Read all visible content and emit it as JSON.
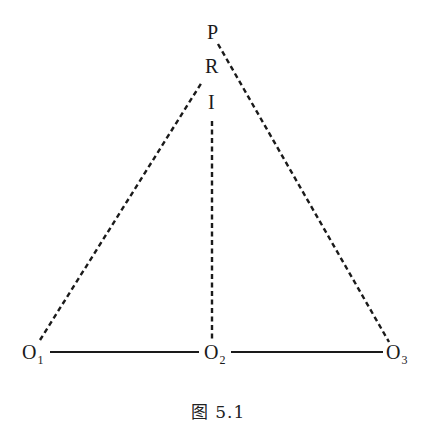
{
  "labels": {
    "P": "P",
    "R": "R",
    "I": "I",
    "O1": {
      "main": "O",
      "sub": "1"
    },
    "O2": {
      "main": "O",
      "sub": "2"
    },
    "O3": {
      "main": "O",
      "sub": "3"
    }
  },
  "caption": "图 5.1",
  "colors": {
    "line": "#1a1a1a",
    "background": "#ffffff"
  }
}
